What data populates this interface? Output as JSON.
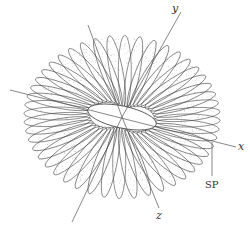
{
  "diagram": {
    "type": "toroidal-helix",
    "colors": {
      "background": "#ffffff",
      "curve": "#3a3a3a",
      "stipple": "#9a9a9a",
      "axis": "#555555",
      "label": "#333333"
    },
    "torus": {
      "center": [
        122,
        117
      ],
      "outer_rx": 98,
      "outer_ry": 80,
      "hole_rx": 35,
      "hole_ry": 11,
      "hole_rotation_deg": 12,
      "windings": 48
    },
    "labels": {
      "x": "x",
      "y": "y",
      "z": "z",
      "sp": "SP"
    }
  }
}
